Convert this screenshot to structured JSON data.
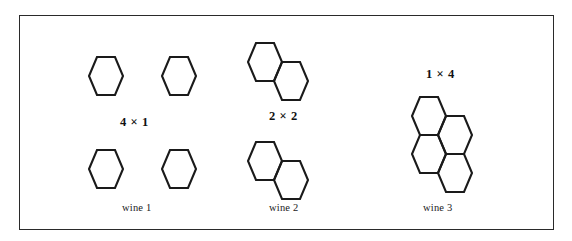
{
  "figure": {
    "type": "hexagonal-cell-partition-diagram",
    "border_color": "#2a2a2a",
    "stroke_color": "#1a1a1a",
    "background_color": "#ffffff",
    "panels": [
      {
        "id": "wine-1",
        "caption": "wine 1",
        "multiplier_label": "4 × 1",
        "groups": 4,
        "cells_per_group": 1,
        "total_cells": 4,
        "arrangement": "four isolated hexagons in a 2 by 2 grid"
      },
      {
        "id": "wine-2",
        "caption": "wine 2",
        "multiplier_label": "2 × 2",
        "groups": 2,
        "cells_per_group": 2,
        "total_cells": 4,
        "arrangement": "two fused hexagon pairs stacked vertically"
      },
      {
        "id": "wine-3",
        "caption": "wine 3",
        "multiplier_label": "1 × 4",
        "groups": 1,
        "cells_per_group": 4,
        "total_cells": 4,
        "arrangement": "single cluster of four fused hexagons"
      }
    ]
  }
}
